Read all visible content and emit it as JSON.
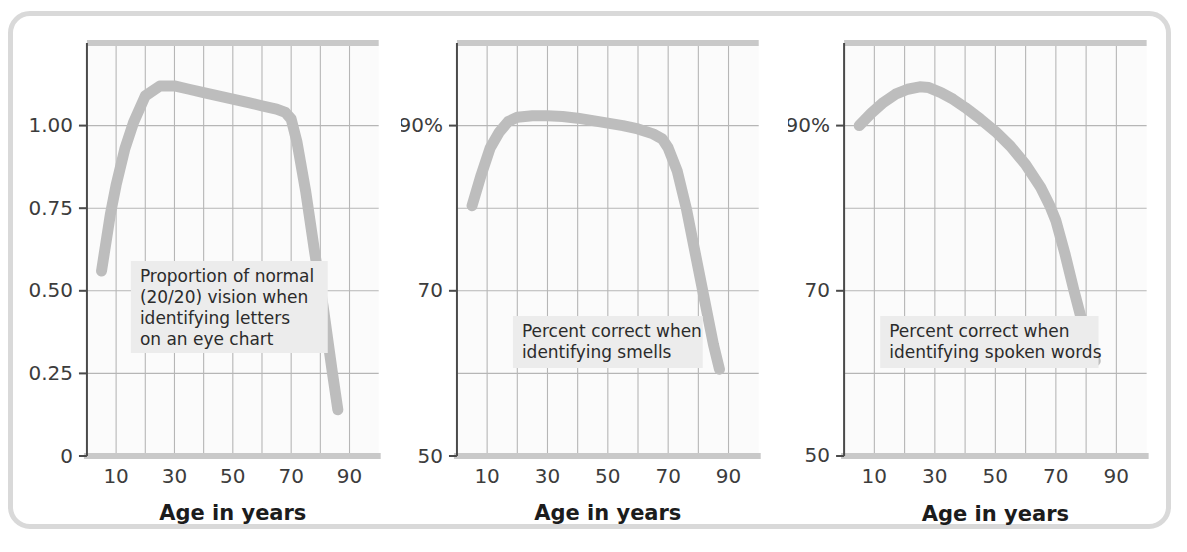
{
  "figure": {
    "frame_color": "#d9d9d9",
    "background_color": "#ffffff",
    "plot_background_color": "#fbfbfb",
    "grid_color": "#b6b6b6",
    "axis_color": "#555555",
    "axis_spine_color": "#c9c9c9",
    "curve_color": "#bdbdbd",
    "annotation_background_color": "#ececec",
    "annotation_text_color": "#2b2b2b",
    "tick_label_color": "#3c3c3c"
  },
  "chart_data": [
    {
      "type": "line",
      "panel_index": 1,
      "title": "",
      "xlabel": "Age in years",
      "ylabel": "",
      "annotation": "Proportion of normal (20/20) vision when identifying letters on an eye chart",
      "annotation_lines": [
        "Proportion of normal",
        "(20/20) vision when",
        "identifying letters",
        "on an eye chart"
      ],
      "xlim": [
        0,
        100
      ],
      "ylim": [
        0,
        1.25
      ],
      "xticks": [
        10,
        30,
        50,
        70,
        90
      ],
      "xtick_labels": [
        "10",
        "30",
        "50",
        "70",
        "90"
      ],
      "xgrid_values": [
        10,
        20,
        30,
        40,
        50,
        60,
        70,
        80,
        90
      ],
      "yticks": [
        0,
        0.25,
        0.5,
        0.75,
        1.0
      ],
      "ytick_labels": [
        "0",
        "0.25",
        "0.50",
        "0.75",
        "1.00"
      ],
      "ygrid_values": [
        0.25,
        0.5,
        0.75,
        1.0
      ],
      "grid": true,
      "legend": "none",
      "x": [
        5,
        8,
        10,
        13,
        16,
        20,
        25,
        30,
        35,
        40,
        45,
        50,
        55,
        60,
        65,
        68,
        70,
        72,
        75,
        78,
        81,
        84,
        86
      ],
      "y": [
        0.56,
        0.73,
        0.82,
        0.93,
        1.01,
        1.09,
        1.12,
        1.12,
        1.11,
        1.1,
        1.09,
        1.08,
        1.07,
        1.06,
        1.05,
        1.04,
        1.02,
        0.95,
        0.8,
        0.62,
        0.45,
        0.26,
        0.14
      ]
    },
    {
      "type": "line",
      "panel_index": 2,
      "title": "",
      "xlabel": "Age in years",
      "ylabel": "",
      "annotation": "Percent correct when identifying smells",
      "annotation_lines": [
        "Percent correct when",
        "identifying smells"
      ],
      "xlim": [
        0,
        100
      ],
      "ylim": [
        50,
        100
      ],
      "xticks": [
        10,
        30,
        50,
        70,
        90
      ],
      "xtick_labels": [
        "10",
        "30",
        "50",
        "70",
        "90"
      ],
      "xgrid_values": [
        10,
        20,
        30,
        40,
        50,
        60,
        70,
        80,
        90
      ],
      "yticks": [
        50,
        70,
        90
      ],
      "ytick_labels": [
        "50",
        "70",
        "90%"
      ],
      "ygrid_values": [
        60,
        70,
        80,
        90
      ],
      "grid": true,
      "legend": "none",
      "x": [
        5,
        8,
        11,
        14,
        17,
        20,
        25,
        30,
        35,
        40,
        45,
        50,
        55,
        60,
        65,
        68,
        70,
        73,
        76,
        79,
        82,
        85,
        87
      ],
      "y": [
        80.3,
        84.0,
        87.3,
        89.2,
        90.5,
        91.0,
        91.2,
        91.2,
        91.1,
        90.9,
        90.6,
        90.3,
        90.0,
        89.6,
        89.0,
        88.4,
        87.3,
        84.5,
        80.0,
        74.5,
        69.0,
        63.5,
        60.5
      ]
    },
    {
      "type": "line",
      "panel_index": 3,
      "title": "",
      "xlabel": "Age in years",
      "ylabel": "",
      "annotation": "Percent correct when identifying spoken words",
      "annotation_lines": [
        "Percent correct when",
        "identifying spoken words"
      ],
      "xlim": [
        0,
        100
      ],
      "ylim": [
        50,
        100
      ],
      "xticks": [
        10,
        30,
        50,
        70,
        90
      ],
      "xtick_labels": [
        "10",
        "30",
        "50",
        "70",
        "90"
      ],
      "xgrid_values": [
        10,
        20,
        30,
        40,
        50,
        60,
        70,
        80,
        90
      ],
      "yticks": [
        50,
        70,
        90
      ],
      "ytick_labels": [
        "50",
        "70",
        "90%"
      ],
      "ygrid_values": [
        60,
        70,
        80,
        90
      ],
      "grid": true,
      "legend": "none",
      "x": [
        5,
        9,
        13,
        17,
        21,
        25,
        28,
        32,
        36,
        40,
        45,
        50,
        55,
        60,
        65,
        68,
        70,
        73,
        76,
        79,
        81,
        83
      ],
      "y": [
        90.0,
        91.5,
        92.8,
        93.8,
        94.4,
        94.7,
        94.6,
        94.0,
        93.2,
        92.2,
        90.8,
        89.3,
        87.5,
        85.3,
        82.5,
        80.3,
        78.5,
        74.5,
        70.0,
        65.8,
        63.2,
        61.5
      ]
    }
  ]
}
